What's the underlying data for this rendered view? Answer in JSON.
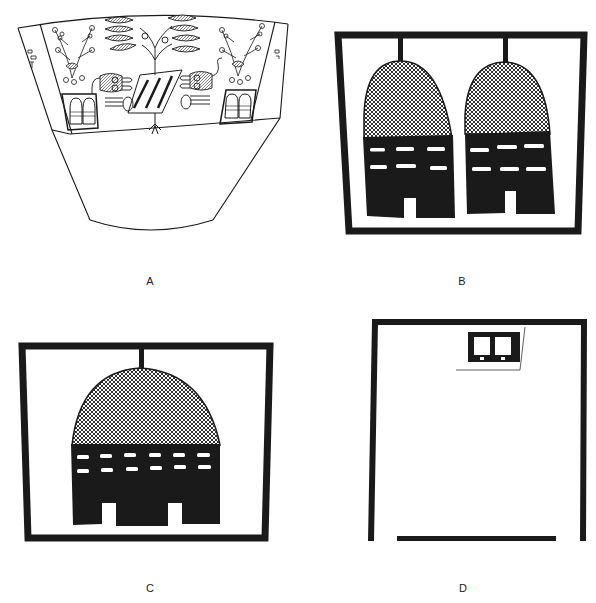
{
  "figure": {
    "panels": [
      {
        "id": "A",
        "label": "A",
        "description": "Conical vessel with painted band: central tree, two feline figures flanking a striped object, flowering plants, and two framed twin-domed house motifs"
      },
      {
        "id": "B",
        "label": "B",
        "description": "Framed panel with two hanging domed houses, cross-hatched domes, dark lower bodies with two rows of white dashes and a central doorway"
      },
      {
        "id": "C",
        "label": "C",
        "description": "Framed panel with a single wide domed house, cross-hatched dome, two rows of six white dashes, two doorways"
      },
      {
        "id": "D",
        "label": "D",
        "description": "Open frame with a small twin-window element at top right and a partial bottom bar"
      }
    ]
  },
  "colors": {
    "ink": "#1a1a1a",
    "paper": "#ffffff",
    "label": "#222222"
  }
}
